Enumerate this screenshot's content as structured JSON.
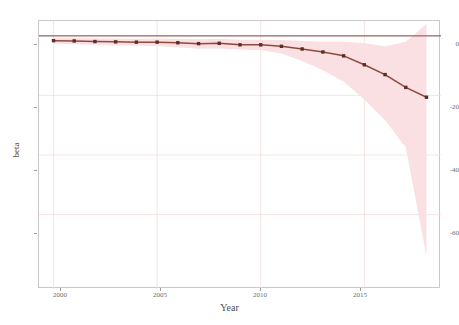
{
  "chart_data": {
    "type": "line",
    "title": "",
    "subtitle": "",
    "xlabel": "Year",
    "ylabel": "beta",
    "x": [
      2000,
      2001,
      2002,
      2003,
      2004,
      2005,
      2006,
      2007,
      2008,
      2009,
      2010,
      2011,
      2012,
      2013,
      2014,
      2015,
      2016,
      2017,
      2018
    ],
    "series": [
      {
        "name": "beta",
        "values": [
          -1.6,
          -1.7,
          -1.9,
          -2.0,
          -2.1,
          -2.1,
          -2.3,
          -2.6,
          -2.5,
          -3.0,
          -3.0,
          -3.5,
          -4.4,
          -5.4,
          -6.7,
          -9.7,
          -13.0,
          -17.3,
          -20.6
        ]
      }
    ],
    "confidence_band": {
      "name": "confidence interval",
      "lower": [
        -2.6,
        -2.8,
        -3.0,
        -3.2,
        -3.3,
        -3.4,
        -3.8,
        -4.3,
        -4.2,
        -4.6,
        -4.7,
        -5.9,
        -8.4,
        -11.5,
        -15.3,
        -21.4,
        -28.3,
        -37.5,
        -74.0
      ],
      "upper": [
        -0.7,
        -0.7,
        -0.8,
        -0.9,
        -1.0,
        -0.9,
        -1.0,
        -1.1,
        -1.0,
        -1.3,
        -1.3,
        -1.4,
        -1.7,
        -2.0,
        -2.0,
        -2.4,
        -3.6,
        -2.0,
        4.0
      ]
    },
    "reference_line": {
      "name": "zero-line",
      "y": 0
    },
    "xticks": [
      2000,
      2005,
      2010,
      2015
    ],
    "yticks": [
      0,
      -20,
      -40,
      -60
    ],
    "xlim": [
      1999.3,
      2018.7
    ],
    "ylim": [
      -85,
      5
    ],
    "grid": true,
    "legend": "none",
    "colors": {
      "line": "#8f4a3e",
      "marker": "#5a2d25",
      "band": "#fadde1",
      "zero_line": "#7d4a45",
      "grid": "#f0d8d8",
      "frame": "#c9c9c9",
      "tick_text": "#6b6b6b",
      "background": "#ffffff"
    }
  },
  "ytick_labels": [
    "0",
    "-20",
    "-40",
    "-60"
  ],
  "xtick_labels": [
    "2000",
    "2005",
    "2010",
    "2015"
  ]
}
